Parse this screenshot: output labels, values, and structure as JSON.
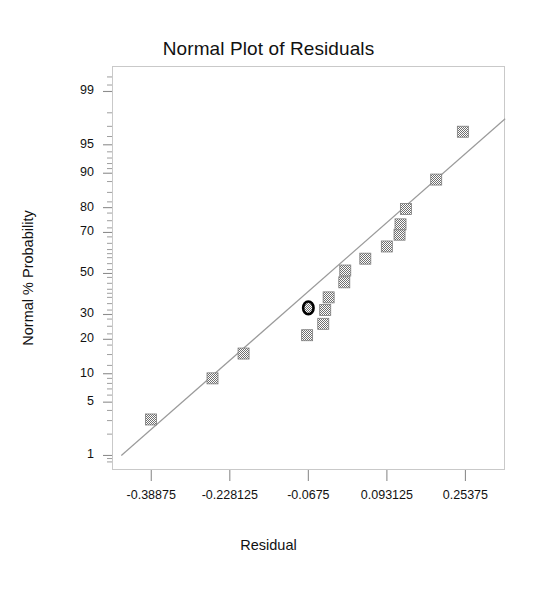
{
  "chart_data": {
    "type": "scatter",
    "title": "Normal Plot of Residuals",
    "xlabel": "Residual",
    "ylabel": "Normal % Probability",
    "grid": false,
    "legend": "none",
    "xlim": [
      -0.469063,
      0.334688
    ],
    "x_tick_labels": [
      "-0.38875",
      "-0.228125",
      "-0.0675",
      "0.093125",
      "0.25375"
    ],
    "x_tick_values": [
      -0.38875,
      -0.228125,
      -0.0675,
      0.093125,
      0.25375
    ],
    "y_scale": "normal-probability",
    "y_tick_labels": [
      "99",
      "95",
      "90",
      "80",
      "70",
      "50",
      "30",
      "20",
      "10",
      "5",
      "1"
    ],
    "y_tick_values": [
      99,
      95,
      90,
      80,
      70,
      50,
      30,
      20,
      10,
      5,
      1
    ],
    "ylim": [
      0.6,
      99.6
    ],
    "marker": "square",
    "marker_color": "#8a8a8a",
    "line_color": "#9a9a9a",
    "reference_line": {
      "name": "normal-reference-line",
      "x1": -0.45,
      "y1": 1.0,
      "x2": 0.335,
      "y2": 97.6
    },
    "points": [
      {
        "x": -0.3895,
        "y": 3.1,
        "highlighted": false
      },
      {
        "x": -0.2635,
        "y": 9.0,
        "highlighted": false
      },
      {
        "x": -0.2,
        "y": 15.3,
        "highlighted": false
      },
      {
        "x": -0.07,
        "y": 21.5,
        "highlighted": false
      },
      {
        "x": -0.037,
        "y": 26.0,
        "highlighted": false
      },
      {
        "x": -0.033,
        "y": 32.0,
        "highlighted": false
      },
      {
        "x": -0.026,
        "y": 38.0,
        "highlighted": false
      },
      {
        "x": 0.006,
        "y": 45.5,
        "highlighted": false
      },
      {
        "x": 0.008,
        "y": 51.5,
        "highlighted": false
      },
      {
        "x": 0.049,
        "y": 57.5,
        "highlighted": false
      },
      {
        "x": 0.093,
        "y": 63.5,
        "highlighted": false
      },
      {
        "x": 0.119,
        "y": 69.0,
        "highlighted": false
      },
      {
        "x": 0.121,
        "y": 73.5,
        "highlighted": false
      },
      {
        "x": 0.132,
        "y": 79.5,
        "highlighted": false
      },
      {
        "x": 0.194,
        "y": 88.5,
        "highlighted": false
      },
      {
        "x": 0.2485,
        "y": 96.5,
        "highlighted": false
      },
      {
        "x": -0.0675,
        "y": 33.0,
        "highlighted": true
      }
    ]
  }
}
